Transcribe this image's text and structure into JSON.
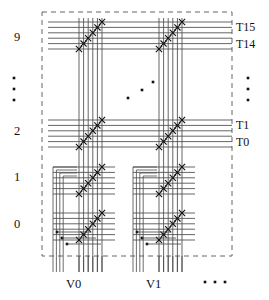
{
  "figure": {
    "kind": "crossbar-switch-schematic",
    "title_text": "",
    "boundary": {
      "style": "dashed",
      "x": 42,
      "y": 12,
      "width": 190,
      "height": 244,
      "color": "#666666"
    },
    "line_color": "#4a4a4a",
    "cross_color": "#111111",
    "dot_color": "#111111"
  },
  "row_labels": [
    {
      "text": "9",
      "x": 14,
      "y": 37
    },
    {
      "text": "2",
      "x": 14,
      "y": 131
    },
    {
      "text": "1",
      "x": 14,
      "y": 177
    },
    {
      "text": "0",
      "x": 14,
      "y": 224
    }
  ],
  "terminal_labels": [
    {
      "text": "T15",
      "x": 236,
      "y": 27
    },
    {
      "text": "T14",
      "x": 236,
      "y": 44
    },
    {
      "text": "T1",
      "x": 236,
      "y": 125
    },
    {
      "text": "T0",
      "x": 236,
      "y": 142
    }
  ],
  "column_labels": [
    {
      "text": "V0",
      "x": 66,
      "y": 285
    },
    {
      "text": "V1",
      "x": 146,
      "y": 285
    }
  ],
  "ellipses": {
    "left_vertical": {
      "x": 14,
      "y": 78,
      "count": 3,
      "spacing": 11
    },
    "right_vertical": {
      "x": 248,
      "y": 78,
      "count": 3,
      "spacing": 11
    },
    "middle_diagonal": {
      "points": [
        [
          128,
          98
        ],
        [
          142,
          90
        ],
        [
          153,
          82
        ]
      ]
    },
    "bottom_horizontal": {
      "x": 205,
      "y": 282,
      "count": 3,
      "spacing": 10
    }
  },
  "columns": [
    {
      "name": "V0",
      "group_x": 79,
      "wire_count": 6,
      "wire_pitch": 4.6
    },
    {
      "name": "V1",
      "group_x": 159,
      "wire_count": 6,
      "wire_pitch": 4.6
    }
  ],
  "row_groups": [
    {
      "label": "9",
      "y_top": 22,
      "line_count": 6,
      "line_pitch": 5.4,
      "type": "through"
    },
    {
      "label": "2",
      "y_top": 120,
      "line_count": 6,
      "line_pitch": 5.4,
      "type": "through"
    },
    {
      "label": "1",
      "y_top": 167,
      "line_count": 6,
      "line_pitch": 5.4,
      "type": "wrapped"
    },
    {
      "label": "0",
      "y_top": 213,
      "line_count": 6,
      "line_pitch": 5.4,
      "type": "wrapped"
    }
  ],
  "crosspoints": {
    "marker": "x-cross",
    "per_block": 6,
    "note": "diagonal chain of crossed switch symbols at each column/row intersection"
  },
  "junction_dots": [
    {
      "x": 57,
      "y": 232
    },
    {
      "x": 62,
      "y": 238
    },
    {
      "x": 67,
      "y": 244
    },
    {
      "x": 137,
      "y": 232
    },
    {
      "x": 142,
      "y": 238
    },
    {
      "x": 147,
      "y": 244
    }
  ]
}
